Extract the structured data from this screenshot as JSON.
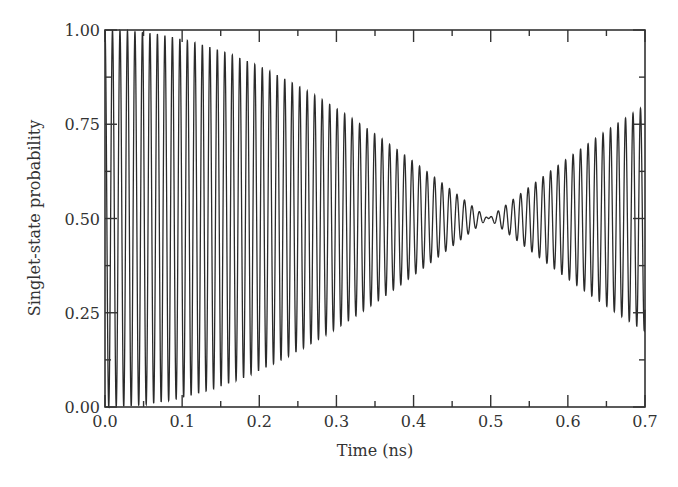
{
  "chart_data": {
    "type": "line",
    "title": "",
    "xlabel": "Time (ns)",
    "ylabel": "Singlet-state probability",
    "xlim": [
      0.0,
      0.7
    ],
    "ylim": [
      0.0,
      1.0
    ],
    "xticks": [
      "0.0",
      "0.1",
      "0.2",
      "0.3",
      "0.4",
      "0.5",
      "0.6",
      "0.7"
    ],
    "yticks": [
      "0.00",
      "0.25",
      "0.50",
      "0.75",
      "1.00"
    ],
    "grid": false,
    "legend": null,
    "series": [
      {
        "name": "Singlet-state probability",
        "model": "P(t) = 0.5 + 0.5*cos(pi*t/(2*T_node)) * cos(2*pi*f*t)",
        "carrier_frequency_GHz": 103,
        "node_time_ns": 0.497,
        "envelope_description": "Fast oscillation between 0 and 1 at t=0; envelope decays to a node at ~0.5 ns (P ~ 0.5), then revives to ~0.22-0.78 at 0.7 ns",
        "x": [
          0.0,
          0.05,
          0.1,
          0.15,
          0.2,
          0.25,
          0.3,
          0.35,
          0.4,
          0.45,
          0.497,
          0.55,
          0.6,
          0.65,
          0.7
        ],
        "upper_envelope": [
          1.0,
          0.997,
          0.988,
          0.972,
          0.95,
          0.924,
          0.892,
          0.855,
          0.816,
          0.574,
          0.5,
          0.583,
          0.656,
          0.724,
          0.785
        ],
        "lower_envelope": [
          0.0,
          0.003,
          0.012,
          0.028,
          0.05,
          0.076,
          0.108,
          0.145,
          0.184,
          0.426,
          0.5,
          0.417,
          0.344,
          0.276,
          0.215
        ]
      }
    ],
    "line_color": "#2b2b2b"
  },
  "axes": {
    "x_label": "Time (ns)",
    "y_label": "Singlet-state probability"
  }
}
